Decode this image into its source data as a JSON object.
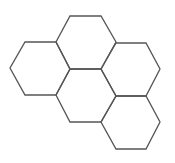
{
  "diagram": {
    "type": "hexagon-honeycomb",
    "background": "#ffffff",
    "stroke_color": "#555555",
    "stroke_width": 1.3,
    "hexagons": [
      {
        "name": "top",
        "points": "70,16 101,16 116,42 101,69 70,69 56,42"
      },
      {
        "name": "left",
        "points": "25,42 56,42 70,69 56,95 25,95 10,68"
      },
      {
        "name": "right",
        "points": "116,43 146,43 160,69 146,96 116,96 101,69"
      },
      {
        "name": "center",
        "points": "70,69 101,69 116,96 101,122 70,122 56,95"
      },
      {
        "name": "bottom-right",
        "points": "116,96 146,96 160,122 146,149 116,149 101,122"
      }
    ]
  }
}
